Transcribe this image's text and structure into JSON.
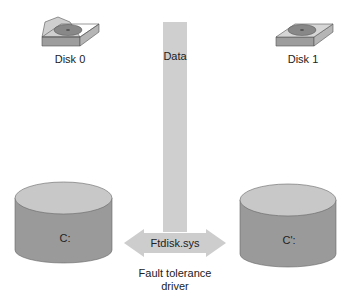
{
  "disks": [
    {
      "label": "Disk 0"
    },
    {
      "label": "Disk 1"
    }
  ],
  "data_bar": {
    "label": "Data"
  },
  "volumes": [
    {
      "label": "C:"
    },
    {
      "label": "C':"
    }
  ],
  "driver": {
    "arrow_label": "Ftdisk.sys",
    "caption_line1": "Fault tolerance",
    "caption_line2": "driver"
  },
  "colors": {
    "bar": "#cfcfcf",
    "cylinder_side": "#9a9a9a",
    "cylinder_top": "#c8c8c8",
    "arrow": "#cdcdcd"
  }
}
